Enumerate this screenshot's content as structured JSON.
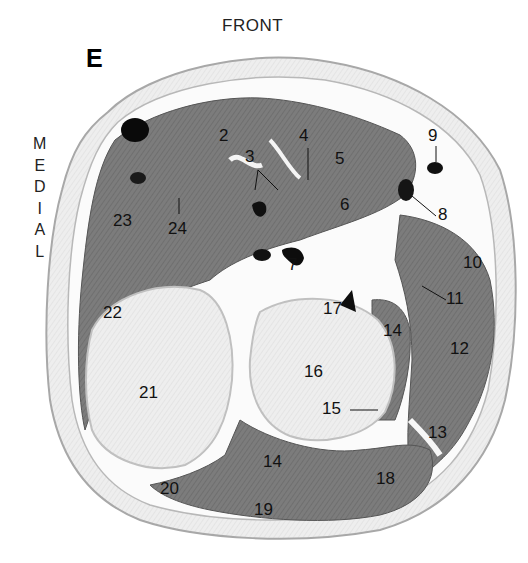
{
  "figure": {
    "panel_letter": "E",
    "orientation": {
      "front": "FRONT",
      "medial_letters": [
        "M",
        "E",
        "D",
        "I",
        "A",
        "L"
      ]
    },
    "labels": [
      {
        "id": "2",
        "text": "2",
        "x": 219,
        "y": 127
      },
      {
        "id": "3",
        "text": "3",
        "x": 245,
        "y": 148
      },
      {
        "id": "4",
        "text": "4",
        "x": 299,
        "y": 127
      },
      {
        "id": "5",
        "text": "5",
        "x": 335,
        "y": 150
      },
      {
        "id": "6",
        "text": "6",
        "x": 340,
        "y": 196
      },
      {
        "id": "7",
        "text": "7",
        "x": 288,
        "y": 256
      },
      {
        "id": "8",
        "text": "8",
        "x": 438,
        "y": 206
      },
      {
        "id": "9",
        "text": "9",
        "x": 428,
        "y": 127
      },
      {
        "id": "10",
        "text": "10",
        "x": 463,
        "y": 254
      },
      {
        "id": "11",
        "text": "11",
        "x": 446,
        "y": 290
      },
      {
        "id": "12",
        "text": "12",
        "x": 450,
        "y": 340
      },
      {
        "id": "13",
        "text": "13",
        "x": 428,
        "y": 424
      },
      {
        "id": "14a",
        "text": "14",
        "x": 383,
        "y": 322
      },
      {
        "id": "14b",
        "text": "14",
        "x": 263,
        "y": 453
      },
      {
        "id": "15",
        "text": "15",
        "x": 322,
        "y": 400
      },
      {
        "id": "16",
        "text": "16",
        "x": 304,
        "y": 363
      },
      {
        "id": "17",
        "text": "17",
        "x": 323,
        "y": 300
      },
      {
        "id": "18",
        "text": "18",
        "x": 376,
        "y": 470
      },
      {
        "id": "19",
        "text": "19",
        "x": 254,
        "y": 501
      },
      {
        "id": "20",
        "text": "20",
        "x": 160,
        "y": 480
      },
      {
        "id": "21",
        "text": "21",
        "x": 139,
        "y": 384
      },
      {
        "id": "22",
        "text": "22",
        "x": 103,
        "y": 304
      },
      {
        "id": "23",
        "text": "23",
        "x": 113,
        "y": 212
      },
      {
        "id": "24",
        "text": "24",
        "x": 168,
        "y": 220
      }
    ]
  }
}
